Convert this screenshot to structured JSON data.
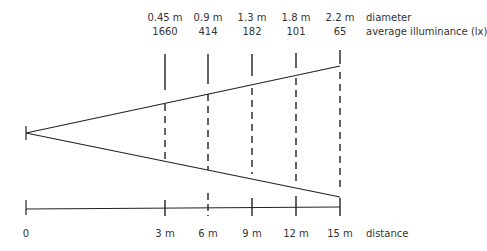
{
  "row_labels": {
    "diameter": "diameter",
    "illuminance": "average illuminance (lx)",
    "distance": "distance"
  },
  "origin_label": "0",
  "stations": [
    {
      "distance": "3 m",
      "diameter": "0.45 m",
      "illuminance": "1660"
    },
    {
      "distance": "6 m",
      "diameter": "0.9 m",
      "illuminance": "414"
    },
    {
      "distance": "9 m",
      "diameter": "1.3 m",
      "illuminance": "182"
    },
    {
      "distance": "12 m",
      "diameter": "1.8 m",
      "illuminance": "101"
    },
    {
      "distance": "15 m",
      "diameter": "2.2 m",
      "illuminance": "65"
    }
  ],
  "colors": {
    "line": "#222222",
    "text": "#333333",
    "background": "#ffffff"
  }
}
